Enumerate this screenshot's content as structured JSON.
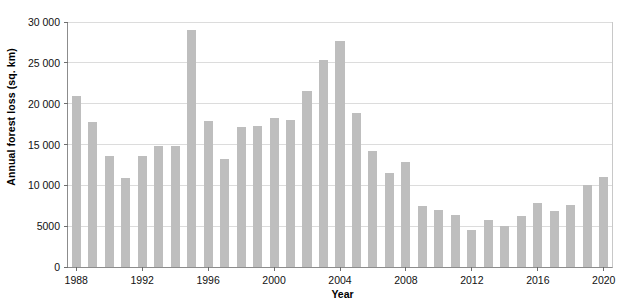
{
  "chart_data": {
    "type": "bar",
    "title": "",
    "xlabel": "Year",
    "ylabel": "Annual forest loss (sq. km)",
    "xlim": [
      1987.5,
      2020.5
    ],
    "ylim": [
      0,
      30000
    ],
    "grid": true,
    "legend": null,
    "bar_color": "#bebebe",
    "ytick_labels": [
      "0",
      "5000",
      "10 000",
      "15 000",
      "20 000",
      "25 000",
      "30 000"
    ],
    "ytick_values": [
      0,
      5000,
      10000,
      15000,
      20000,
      25000,
      30000
    ],
    "xtick_labels": [
      "1988",
      "1992",
      "1996",
      "2000",
      "2004",
      "2008",
      "2012",
      "2016",
      "2020"
    ],
    "xtick_values": [
      1988,
      1992,
      1996,
      2000,
      2004,
      2008,
      2012,
      2016,
      2020
    ],
    "categories": [
      1988,
      1989,
      1990,
      1991,
      1992,
      1993,
      1994,
      1995,
      1996,
      1997,
      1998,
      1999,
      2000,
      2001,
      2002,
      2003,
      2004,
      2005,
      2006,
      2007,
      2008,
      2009,
      2010,
      2011,
      2012,
      2013,
      2014,
      2015,
      2016,
      2017,
      2018,
      2019,
      2020
    ],
    "values": [
      20900,
      17700,
      13600,
      10900,
      13600,
      14800,
      14800,
      29000,
      17900,
      13200,
      17200,
      17300,
      18200,
      18000,
      21600,
      25300,
      27700,
      18900,
      14200,
      11500,
      12800,
      7500,
      7000,
      6400,
      4500,
      5800,
      5000,
      6200,
      7800,
      6900,
      7600,
      10000,
      11000
    ]
  }
}
